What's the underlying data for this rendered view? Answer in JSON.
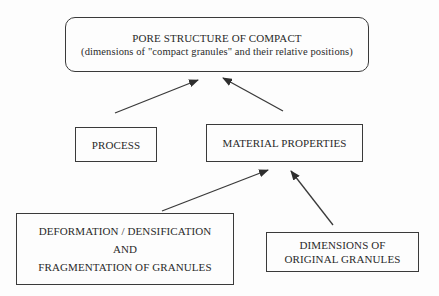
{
  "diagram": {
    "top_box": {
      "title": "PORE STRUCTURE OF COMPACT",
      "subtitle": "(dimensions of \"compact granules\" and their relative positions)"
    },
    "process_box": {
      "label": "PROCESS"
    },
    "material_box": {
      "label": "MATERIAL PROPERTIES"
    },
    "deformation_box": {
      "line1": "DEFORMATION / DENSIFICATION",
      "line2": "AND",
      "line3": "FRAGMENTATION OF GRANULES"
    },
    "dimensions_box": {
      "line1": "DIMENSIONS OF",
      "line2": "ORIGINAL GRANULES"
    },
    "edges": [
      {
        "from": "PROCESS",
        "to": "PORE STRUCTURE OF COMPACT"
      },
      {
        "from": "MATERIAL PROPERTIES",
        "to": "PORE STRUCTURE OF COMPACT"
      },
      {
        "from": "DEFORMATION / DENSIFICATION AND FRAGMENTATION OF GRANULES",
        "to": "MATERIAL PROPERTIES"
      },
      {
        "from": "DIMENSIONS OF ORIGINAL GRANULES",
        "to": "MATERIAL PROPERTIES"
      }
    ],
    "colors": {
      "stroke": "#3a3a3a",
      "text": "#2a2a2a",
      "background": "#fdfdfd"
    }
  }
}
